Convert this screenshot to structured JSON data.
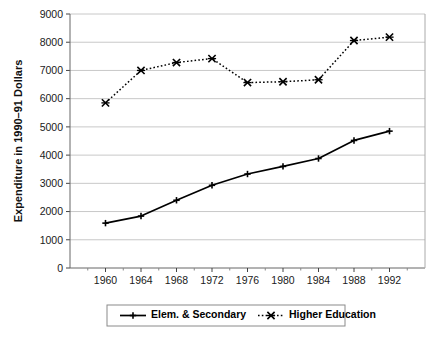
{
  "chart_data": {
    "type": "line",
    "title": "",
    "xlabel": "",
    "ylabel": "Expenditure in 1990–91 Dollars",
    "categories": [
      1960,
      1964,
      1968,
      1972,
      1976,
      1980,
      1984,
      1988,
      1992
    ],
    "x_tick_labels": [
      "1960",
      "1964",
      "1968",
      "1972",
      "1976",
      "1980",
      "1984",
      "1988",
      "1992"
    ],
    "y_tick_labels": [
      "0",
      "1000",
      "2000",
      "3000",
      "4000",
      "5000",
      "6000",
      "7000",
      "8000",
      "9000"
    ],
    "y_ticks": [
      0,
      1000,
      2000,
      3000,
      4000,
      5000,
      6000,
      7000,
      8000,
      9000
    ],
    "ylim": [
      0,
      9000
    ],
    "xlim": [
      1958,
      1994
    ],
    "grid": "horizontal",
    "legend_position": "bottom",
    "series": [
      {
        "name": "Elem. & Secondary",
        "marker": "plus",
        "line_style": "solid",
        "color": "#000000",
        "values": [
          1590,
          1840,
          2400,
          2930,
          3330,
          3600,
          3880,
          4520,
          4850
        ]
      },
      {
        "name": "Higher Education",
        "marker": "cross",
        "line_style": "dotted",
        "color": "#000000",
        "values": [
          5850,
          7000,
          7280,
          7420,
          6570,
          6600,
          6670,
          8060,
          8180
        ]
      }
    ]
  },
  "legend": {
    "items": [
      {
        "label": "Elem. & Secondary",
        "marker": "plus",
        "line_style": "solid"
      },
      {
        "label": "Higher Education",
        "marker": "cross",
        "line_style": "dotted"
      }
    ]
  },
  "colors": {
    "background": "#ffffff",
    "gridline": "#c8c8c8",
    "axis": "#555555",
    "series": "#000000",
    "legend_border": "#8a8a8a"
  }
}
